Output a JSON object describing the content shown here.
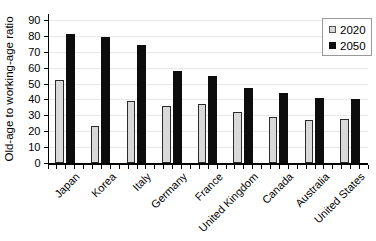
{
  "chart_data": {
    "type": "bar",
    "title": "",
    "ylabel": "Old-age to working-age ratio",
    "xlabel": "",
    "ylim": [
      0,
      90
    ],
    "yticks": [
      0,
      10,
      20,
      30,
      40,
      50,
      60,
      70,
      80,
      90
    ],
    "grid": "horizontal faint gridlines every 10",
    "legend_position": "top-right inside plot",
    "categories": [
      "Japan",
      "Korea",
      "Italy",
      "Germany",
      "France",
      "United Kingdom",
      "Canada",
      "Australia",
      "United States"
    ],
    "series": [
      {
        "name": "2020",
        "color": "#d9d9d9",
        "values": [
          52,
          23,
          39,
          36,
          37,
          32,
          29,
          27,
          28
        ]
      },
      {
        "name": "2050",
        "color": "#0d0d0d",
        "values": [
          81,
          79,
          74,
          58,
          55,
          47,
          44,
          41,
          40
        ]
      }
    ],
    "colors": {
      "background": "#ffffff",
      "axis": "#000000",
      "gridline": "#e9e9e9",
      "legend_border": "#999999"
    }
  }
}
